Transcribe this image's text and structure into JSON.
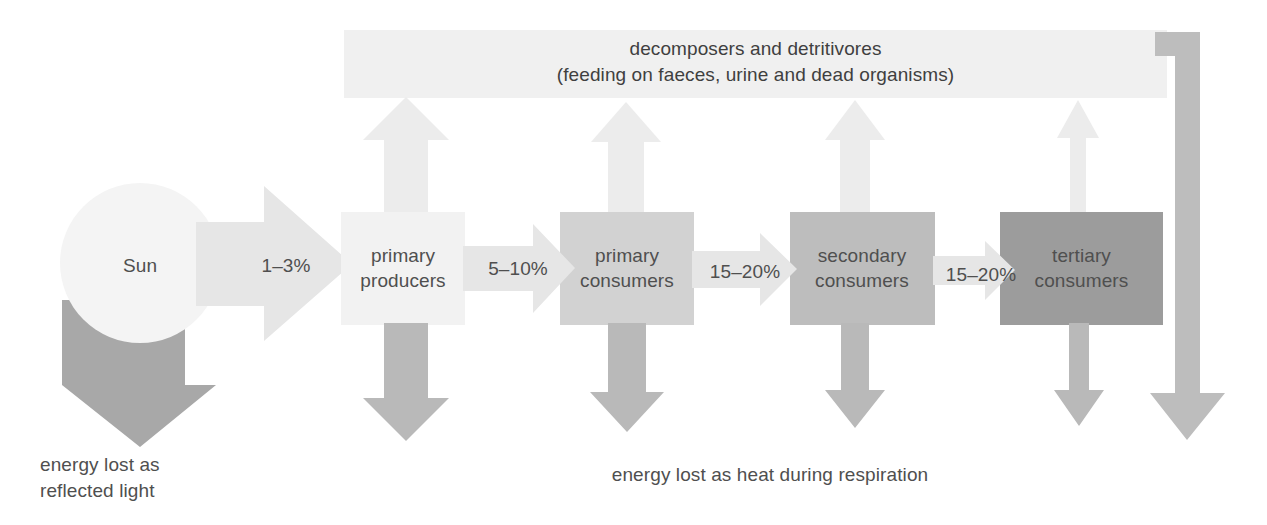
{
  "diagram": {
    "title_text": "decomposers and detritivores\n(feeding on faeces, urine and dead organisms)",
    "banner": {
      "line1": "decomposers and detritivores",
      "line2": "(feeding on faeces, urine and dead organisms)",
      "full": "decomposers and detritivores\n(feeding on faeces, urine and dead organisms)"
    },
    "source": {
      "label": "Sun"
    },
    "nodes": [
      {
        "id": "primary-producers",
        "label": "primary\nproducers",
        "color": "#f2f2f2"
      },
      {
        "id": "primary-consumers",
        "label": "primary\nconsumers",
        "color": "#d2d2d2"
      },
      {
        "id": "secondary-consumers",
        "label": "secondary\nconsumers",
        "color": "#bdbdbd"
      },
      {
        "id": "tertiary-consumers",
        "label": "tertiary\nconsumers",
        "color": "#9c9c9c"
      }
    ],
    "transfers": [
      {
        "id": "sun-to-producers",
        "label": "1–3%"
      },
      {
        "id": "producers-to-primary",
        "label": "5–10%"
      },
      {
        "id": "primary-to-secondary",
        "label": "15–20%"
      },
      {
        "id": "secondary-to-tertiary",
        "label": "15–20%"
      }
    ],
    "captions": [
      {
        "id": "reflected-light",
        "label": "energy lost as\nreflected light",
        "line1": "energy lost as",
        "line2": "reflected light"
      },
      {
        "id": "respiration-heat",
        "label": "energy lost as heat during respiration"
      }
    ],
    "colors": {
      "banner_fill": "#f0f0f0",
      "up_arrow_fill": "#ececec",
      "down_arrow_fill": "#b9b9b9",
      "transfer_arrow_fill": "#e6e6e6",
      "sun_fill": "#f4f4f4",
      "sun_loss_arrow_fill": "#a8a8a8",
      "return_arrow_fill": "#bdbdbd",
      "text": "#4f4f4f",
      "background": "#ffffff"
    }
  }
}
